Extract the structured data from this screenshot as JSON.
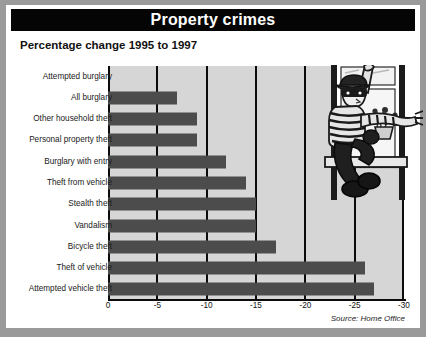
{
  "title": "Property crimes",
  "subtitle": "Percentage change 1995 to 1997",
  "source": "Source: Home Office",
  "illustration": "burglar-climbing-window-illustration",
  "colors": {
    "title_bar_bg": "#050505",
    "title_text": "#ffffff",
    "card_bg": "#ffffff",
    "plot_bg": "#d6d6d6",
    "bar": "#4c4c4c",
    "axis": "#0b0b0b",
    "page_bg": "#9a9a9a"
  },
  "chart_data": {
    "type": "bar",
    "orientation": "horizontal",
    "title": "Property crimes",
    "subtitle": "Percentage change 1995 to 1997",
    "xlabel": "",
    "ylabel": "",
    "xlim": [
      0,
      -30
    ],
    "xticks": [
      0,
      -5,
      -10,
      -15,
      -20,
      -25,
      -30
    ],
    "xtick_labels": [
      "0",
      "-5",
      "-10",
      "-15",
      "-20",
      "-25",
      "-30"
    ],
    "grid": true,
    "grid_axis": "x",
    "legend": false,
    "source": "Source: Home Office",
    "categories": [
      "Attempted burglary",
      "All burglary",
      "Other household theft",
      "Personal property theft",
      "Burglary with entry",
      "Theft from vehicle",
      "Stealth theft",
      "Vandalism",
      "Bicycle theft",
      "Theft of vehicle",
      "Attempted vehicle theft"
    ],
    "values": [
      0,
      -7,
      -9,
      -9,
      -12,
      -14,
      -15,
      -15,
      -17,
      -26,
      -27
    ]
  }
}
